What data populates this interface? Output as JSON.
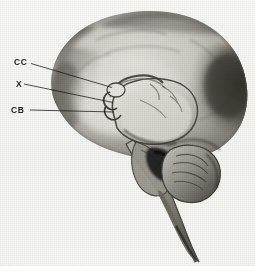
{
  "figure": {
    "kind": "anatomical-photograph",
    "view": "midsagittal-section",
    "caption": "",
    "background_color": "#f7f7f5",
    "ink_color": "#1a1a1a"
  },
  "labels": [
    {
      "id": "cc",
      "text": "CC",
      "name": "corpus-callosum",
      "x": 14,
      "y": 57.5,
      "leader": {
        "x1": 31,
        "y1": 63.5,
        "x2": 112,
        "y2": 87.5
      }
    },
    {
      "id": "x",
      "text": "X",
      "name": "unlabeled-structure-x",
      "x": 16,
      "y": 79.5,
      "leader": {
        "x1": 24,
        "y1": 84.0,
        "x2": 113,
        "y2": 102.5
      }
    },
    {
      "id": "cb",
      "text": "CB",
      "name": "cerebellum",
      "x": 11,
      "y": 105.5,
      "leader": {
        "x1": 30,
        "y1": 110.0,
        "x2": 114,
        "y2": 112.0
      }
    }
  ],
  "regions": [
    {
      "name": "cerebral-hemisphere",
      "tone": "mid-gray"
    },
    {
      "name": "occipital-shadow",
      "tone": "dark-gray"
    },
    {
      "name": "corpus-callosum",
      "tone": "light-gray"
    },
    {
      "name": "thalamus-diencephalon",
      "tone": "light-gray"
    },
    {
      "name": "midbrain",
      "tone": "mid-gray"
    },
    {
      "name": "pons",
      "tone": "mid-gray"
    },
    {
      "name": "medulla-oblongata",
      "tone": "mid-gray"
    },
    {
      "name": "fourth-ventricle",
      "tone": "black"
    },
    {
      "name": "cerebellum",
      "tone": "mid-gray"
    }
  ],
  "colors": {
    "paper": "#f7f7f5",
    "ink": "#1a1a1a",
    "tissue_light": "#d6d4cf",
    "tissue_mid": "#a7a49d",
    "tissue_dark": "#5e5b55",
    "tissue_darkest": "#2b2926"
  }
}
